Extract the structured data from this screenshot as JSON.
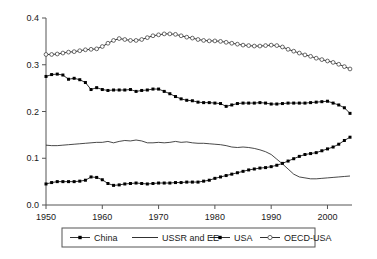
{
  "chart_data": {
    "type": "line",
    "title": "",
    "subtitle": "",
    "xlabel": "",
    "ylabel": "",
    "xlim": [
      1950,
      2004
    ],
    "ylim": [
      0.0,
      0.4
    ],
    "grid": false,
    "legend_position": "bottom",
    "x_ticks": [
      "1950",
      "1960",
      "1970",
      "1980",
      "1990",
      "2000"
    ],
    "x_tick_values": [
      1950,
      1960,
      1970,
      1980,
      1990,
      2000
    ],
    "y_ticks": [
      "0.0",
      "0.1",
      "0.2",
      "0.3",
      "0.4"
    ],
    "y_tick_values": [
      0.0,
      0.1,
      0.2,
      0.3,
      0.4
    ],
    "x": [
      1950,
      1951,
      1952,
      1953,
      1954,
      1955,
      1956,
      1957,
      1958,
      1959,
      1960,
      1961,
      1962,
      1963,
      1964,
      1965,
      1966,
      1967,
      1968,
      1969,
      1970,
      1971,
      1972,
      1973,
      1974,
      1975,
      1976,
      1977,
      1978,
      1979,
      1980,
      1981,
      1982,
      1983,
      1984,
      1985,
      1986,
      1987,
      1988,
      1989,
      1990,
      1991,
      1992,
      1993,
      1994,
      1995,
      1996,
      1997,
      1998,
      1999,
      2000,
      2001,
      2002,
      2003,
      2004
    ],
    "series": [
      {
        "name": "China",
        "marker": "filled-square",
        "line": "solid",
        "values": [
          0.045,
          0.048,
          0.05,
          0.05,
          0.05,
          0.05,
          0.051,
          0.053,
          0.06,
          0.059,
          0.054,
          0.046,
          0.042,
          0.043,
          0.045,
          0.046,
          0.047,
          0.046,
          0.045,
          0.046,
          0.047,
          0.047,
          0.047,
          0.048,
          0.048,
          0.049,
          0.049,
          0.049,
          0.051,
          0.053,
          0.057,
          0.06,
          0.063,
          0.066,
          0.069,
          0.072,
          0.075,
          0.077,
          0.079,
          0.08,
          0.082,
          0.085,
          0.089,
          0.094,
          0.099,
          0.104,
          0.108,
          0.11,
          0.112,
          0.116,
          0.12,
          0.124,
          0.13,
          0.138,
          0.145
        ]
      },
      {
        "name": "USSR and EE",
        "marker": "none",
        "line": "solid",
        "values": [
          0.128,
          0.127,
          0.127,
          0.128,
          0.129,
          0.13,
          0.131,
          0.132,
          0.133,
          0.134,
          0.134,
          0.136,
          0.133,
          0.136,
          0.138,
          0.137,
          0.139,
          0.137,
          0.133,
          0.133,
          0.134,
          0.133,
          0.134,
          0.136,
          0.134,
          0.135,
          0.133,
          0.132,
          0.132,
          0.131,
          0.13,
          0.129,
          0.127,
          0.124,
          0.123,
          0.124,
          0.123,
          0.121,
          0.118,
          0.114,
          0.108,
          0.098,
          0.088,
          0.077,
          0.066,
          0.06,
          0.058,
          0.056,
          0.056,
          0.057,
          0.058,
          0.059,
          0.06,
          0.061,
          0.062
        ]
      },
      {
        "name": "USA",
        "marker": "filled-square",
        "line": "solid",
        "values": [
          0.275,
          0.279,
          0.28,
          0.278,
          0.269,
          0.271,
          0.268,
          0.262,
          0.247,
          0.251,
          0.247,
          0.245,
          0.246,
          0.246,
          0.246,
          0.247,
          0.243,
          0.245,
          0.246,
          0.248,
          0.248,
          0.243,
          0.238,
          0.232,
          0.227,
          0.224,
          0.223,
          0.22,
          0.219,
          0.219,
          0.218,
          0.217,
          0.211,
          0.214,
          0.217,
          0.218,
          0.218,
          0.218,
          0.219,
          0.218,
          0.216,
          0.216,
          0.217,
          0.218,
          0.218,
          0.218,
          0.218,
          0.219,
          0.22,
          0.221,
          0.222,
          0.218,
          0.214,
          0.208,
          0.196
        ]
      },
      {
        "name": "OECD-USA",
        "marker": "open-circle",
        "line": "solid",
        "values": [
          0.322,
          0.322,
          0.323,
          0.325,
          0.327,
          0.328,
          0.33,
          0.332,
          0.333,
          0.334,
          0.339,
          0.346,
          0.352,
          0.356,
          0.354,
          0.352,
          0.352,
          0.354,
          0.358,
          0.362,
          0.364,
          0.366,
          0.366,
          0.365,
          0.362,
          0.359,
          0.357,
          0.354,
          0.352,
          0.351,
          0.351,
          0.35,
          0.348,
          0.346,
          0.344,
          0.342,
          0.341,
          0.34,
          0.34,
          0.341,
          0.342,
          0.341,
          0.338,
          0.333,
          0.329,
          0.325,
          0.321,
          0.318,
          0.314,
          0.311,
          0.308,
          0.305,
          0.301,
          0.296,
          0.291
        ]
      }
    ]
  },
  "legend": {
    "items": [
      {
        "label": "China",
        "marker": "filled-square"
      },
      {
        "label": "USSR and EE",
        "marker": "none"
      },
      {
        "label": "USA",
        "marker": "filled-square"
      },
      {
        "label": "OECD-USA",
        "marker": "open-circle"
      }
    ]
  },
  "colors": {
    "axis": "#555555",
    "series": "#1a1a1a",
    "marker_fill": "#000000",
    "marker_open_fill": "#ffffff",
    "background": "#ffffff"
  }
}
